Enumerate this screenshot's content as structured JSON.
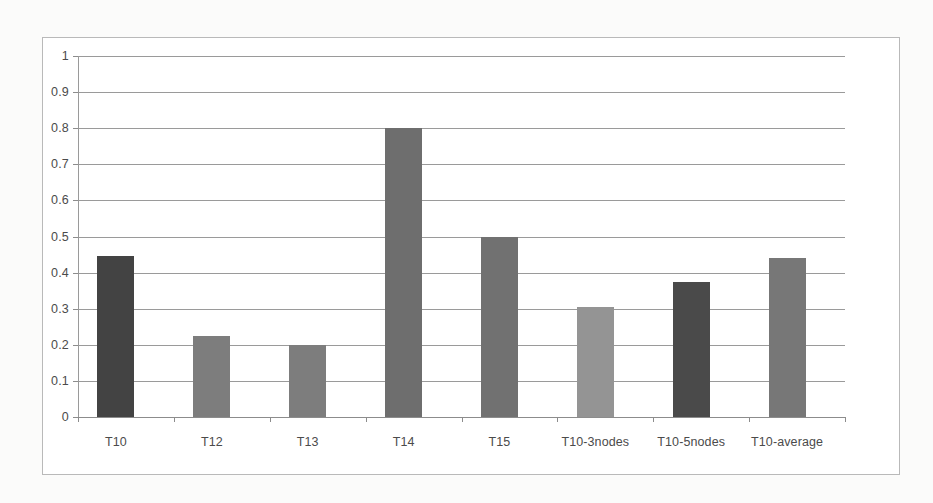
{
  "chart_data": {
    "type": "bar",
    "title": "",
    "xlabel": "",
    "ylabel": "",
    "categories": [
      "T10",
      "T12",
      "T13",
      "T14",
      "T15",
      "T10-3nodes",
      "T10-5nodes",
      "T10-average"
    ],
    "values": [
      0.445,
      0.225,
      0.2,
      0.8,
      0.5,
      0.305,
      0.375,
      0.44
    ],
    "bar_colors": [
      "#434343",
      "#7d7d7d",
      "#7d7d7d",
      "#6e6e6e",
      "#717171",
      "#949494",
      "#4a4a4a",
      "#777777"
    ],
    "ylim": [
      0,
      1
    ],
    "ytick_labels": [
      "1",
      "0.9",
      "0.8",
      "0.7",
      "0.6",
      "0.5",
      "0.4",
      "0.3",
      "0.2",
      "0.1",
      "0"
    ],
    "ytick_values": [
      1,
      0.9,
      0.8,
      0.7,
      0.6,
      0.5,
      0.4,
      0.3,
      0.2,
      0.1,
      0
    ],
    "grid": true,
    "grid_color": "#9a9a9a",
    "legend": null,
    "legend_position": "none",
    "plot_background": "#ffffff",
    "frame_color": "#b9b9b9"
  }
}
